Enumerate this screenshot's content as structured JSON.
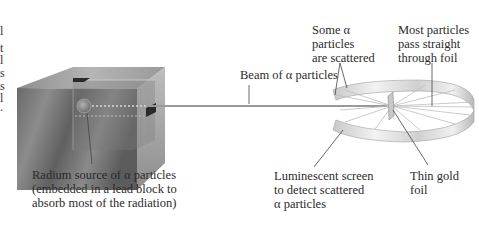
{
  "diagram": {
    "labels": {
      "beam": "Beam of α particles",
      "some_scattered": "Some α\nparticles\nare scattered",
      "most_pass": "Most particles\npass straight\nthrough foil",
      "source": "Radium source of α particles\n(embedded in a lead block to\nabsorb most of the radiation)",
      "screen": "Luminescent screen\nto detect scattered\nα particles",
      "foil": "Thin gold\nfoil"
    },
    "clipped_left_text": [
      "l",
      "t",
      "l",
      "s",
      "s",
      "l",
      "."
    ],
    "components": [
      {
        "name": "lead-block",
        "description": "Gray lead block containing radium source"
      },
      {
        "name": "alpha-beam",
        "description": "Straight beam line from source to foil"
      },
      {
        "name": "gold-foil",
        "description": "Thin gold foil at center of screen"
      },
      {
        "name": "luminescent-screen",
        "description": "Open circular band screen around foil"
      },
      {
        "name": "scatter-rays",
        "description": "Radial lines showing particle deflection"
      }
    ],
    "colors": {
      "lead_dark": "#5e5e5e",
      "lead_light": "#a8a8a8",
      "screen": "#d9d9d9",
      "beam": "#9a9a9a",
      "leader_line": "#444444"
    }
  }
}
